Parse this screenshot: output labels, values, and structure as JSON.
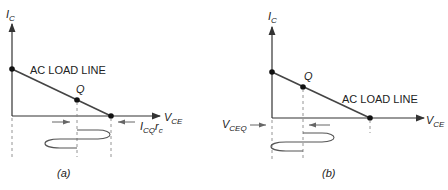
{
  "diagrams": [
    {
      "id": "a",
      "caption": "(a)",
      "y_axis_label": "I",
      "y_axis_sub": "C",
      "x_axis_label": "V",
      "x_axis_sub": "CE",
      "load_line_label": "AC LOAD LINE",
      "q_label": "Q",
      "annotation_main": "I",
      "annotation_sub": "CQ",
      "annotation_tail": "r",
      "annotation_tail_sub": "c"
    },
    {
      "id": "b",
      "caption": "(b)",
      "y_axis_label": "I",
      "y_axis_sub": "C",
      "x_axis_label": "V",
      "x_axis_sub": "CE",
      "load_line_label": "AC LOAD LINE",
      "q_label": "Q",
      "annotation_main": "V",
      "annotation_sub": "CEQ"
    }
  ],
  "colors": {
    "line": "#333333",
    "arrow": "#555555",
    "dash": "#777777"
  }
}
